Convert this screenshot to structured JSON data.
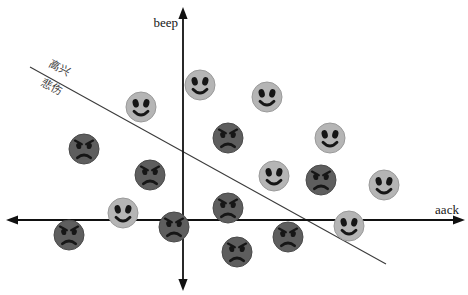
{
  "chart_data": {
    "type": "scatter",
    "title": "",
    "xlabel": "aack",
    "ylabel": "beep",
    "legend": "none",
    "grid": false,
    "axis_ticks": "none",
    "note": "conceptual classification plot; coordinates are pixel positions (y grows downward), axes cross at origin",
    "axes": {
      "origin": [
        183,
        220
      ],
      "x_axis": {
        "y": 220,
        "from": 6,
        "to": 465
      },
      "y_axis": {
        "x": 183,
        "from": 7,
        "to": 291
      },
      "color": "#111111",
      "stroke_width": 1.8
    },
    "boundary_line": {
      "from": [
        30,
        67
      ],
      "to": [
        386,
        264
      ],
      "color": "#3c3c3c",
      "stroke_width": 1.1,
      "label_above": "高兴",
      "label_below": "悲伤",
      "label_rotation_deg": 29
    },
    "marker_radius": 15,
    "feature_color": "#161616",
    "series": [
      {
        "name": "happy",
        "marker": "happy-face",
        "face_color": "#b5b5b5",
        "edge_color": "#9a9a9a",
        "points": [
          [
            141,
            107
          ],
          [
            200,
            85
          ],
          [
            267,
            97
          ],
          [
            330,
            138
          ],
          [
            123,
            213
          ],
          [
            274,
            176
          ],
          [
            384,
            185
          ],
          [
            349,
            226
          ]
        ]
      },
      {
        "name": "sad",
        "marker": "angry-face",
        "face_color": "#5e5e5e",
        "edge_color": "#4a4a4a",
        "points": [
          [
            84,
            149
          ],
          [
            150,
            175
          ],
          [
            228,
            138
          ],
          [
            69,
            235
          ],
          [
            174,
            227
          ],
          [
            228,
            208
          ],
          [
            237,
            252
          ],
          [
            321,
            180
          ],
          [
            288,
            237
          ]
        ]
      }
    ]
  }
}
